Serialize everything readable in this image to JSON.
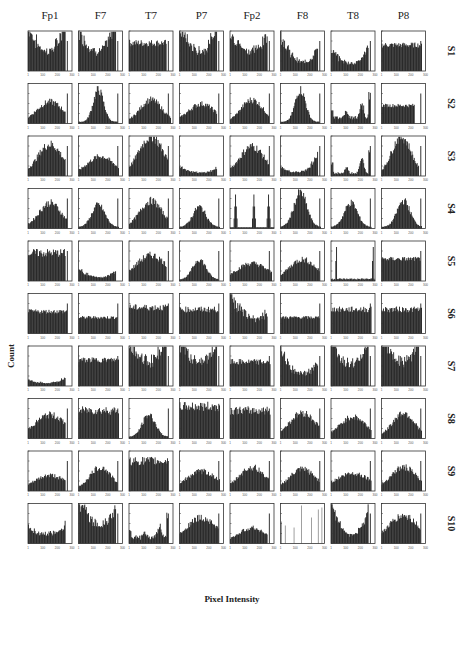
{
  "chart_data": {
    "type": "bar",
    "title": "",
    "xlabel": "Pixel Intensity",
    "ylabel": "Count",
    "grid": false,
    "layout": "grid of histograms, rows = subjects, columns = EEG channels",
    "columns": [
      "Fp1",
      "F7",
      "T7",
      "P7",
      "Fp2",
      "F8",
      "T8",
      "P8"
    ],
    "rows": [
      "S1",
      "S2",
      "S3",
      "S4",
      "S5",
      "S6",
      "S7",
      "S8",
      "S9",
      "S10"
    ],
    "xlim": [
      1,
      300
    ],
    "x_ticks": [
      "1",
      "100",
      "200",
      "300"
    ],
    "bins": 60,
    "panels": [
      [
        "ushape:0.35,0.75,0.9",
        "ushape:0.35,0.7,0.95",
        "flat:0.7,0.25,0.85",
        "ushape:0.35,0.8,0.8",
        "ushape:0.4,0.6,0.55",
        "ushape:0.1,0.85,0.5",
        "ushape:0.12,0.4,0.45",
        "flat:0.65,0.2,0.92"
      ],
      [
        "bell:0.5,0.3,0.5,0.85",
        "bell:0.45,0.12,0.8,0.9",
        "bell:0.5,0.25,0.55,0.95",
        "bell:0.5,0.3,0.45,0.85",
        "bell:0.5,0.25,0.55,0.9",
        "bell:0.45,0.12,0.8,0.9",
        "multi:0.1,0.35,0.7",
        "flat:0.45,0.2,0.75"
      ],
      [
        "bell:0.5,0.28,0.75,0.85",
        "bell:0.5,0.3,0.45,0.92",
        "bell:0.5,0.28,0.95,0.9",
        "ushape:0.05,0.2,0.15",
        "bell:0.5,0.28,0.7,0.9",
        "ushape:0.05,0.15,0.5",
        "multi:0.05,0.35,0.6",
        "bell:0.45,0.22,0.95,0.85"
      ],
      [
        "bell:0.5,0.25,0.6,0.9",
        "bell:0.45,0.15,0.55,0.92",
        "bell:0.5,0.25,0.65,0.9",
        "bell:0.45,0.15,0.5,0.92",
        "spikes:0.12,0.55,0.88",
        "bell:0.45,0.15,0.85,0.92",
        "bell:0.45,0.15,0.6,0.92",
        "bell:0.5,0.15,0.65,0.92"
      ],
      [
        "flat:0.7,0.3,0.85",
        "ushape:0.05,0.25,0.2",
        "bell:0.5,0.35,0.6,0.85",
        "bell:0.45,0.15,0.5,0.9",
        "bell:0.5,0.35,0.4,0.95",
        "bell:0.5,0.3,0.5,0.9",
        "spikes2:0.1,0.95",
        "flat:0.55,0.2,0.9"
      ],
      [
        "flat:0.55,0.2,0.9",
        "flat:0.4,0.2,0.9",
        "flat:0.65,0.25,0.9",
        "flat:0.6,0.25,0.9",
        "ushape:0.3,0.75,0.25",
        "flat:0.4,0.2,0.9",
        "flat:0.6,0.25,0.92",
        "flat:0.6,0.25,0.92"
      ],
      [
        "ushape:0.05,0.1,0.15",
        "flat:0.65,0.2,0.92",
        "ushape:0.5,0.65,0.7",
        "ushape:0.5,0.65,0.6",
        "flat:0.6,0.25,0.92",
        "ushape:0.2,0.7,0.45",
        "ushape:0.45,0.75,0.7",
        "ushape:0.5,0.7,0.65"
      ],
      [
        "bell:0.5,0.35,0.55,0.85",
        "flat:0.7,0.3,0.92",
        "bell:0.45,0.15,0.55,0.9",
        "flat:0.8,0.3,0.92",
        "flat:0.7,0.3,0.92",
        "bell:0.5,0.3,0.6,0.9",
        "bell:0.5,0.3,0.5,0.92",
        "bell:0.5,0.25,0.6,0.92"
      ],
      [
        "bell:0.5,0.35,0.35,0.85",
        "bell:0.5,0.25,0.55,0.9",
        "flat:0.75,0.3,0.9",
        "bell:0.5,0.35,0.45,0.92",
        "bell:0.5,0.3,0.55,0.9",
        "bell:0.5,0.3,0.5,0.9",
        "bell:0.5,0.4,0.4,0.92",
        "bell:0.5,0.3,0.55,0.92"
      ],
      [
        "ushape:0.2,0.2,0.25",
        "ushape:0.35,0.8,0.55",
        "multi:0.1,0.3,0.7",
        "bell:0.5,0.35,0.6,0.9",
        "bell:0.5,0.3,0.35,0.85",
        "lines",
        "ushape:0.05,0.95,0.85",
        "bell:0.5,0.35,0.65,0.9"
      ]
    ]
  }
}
